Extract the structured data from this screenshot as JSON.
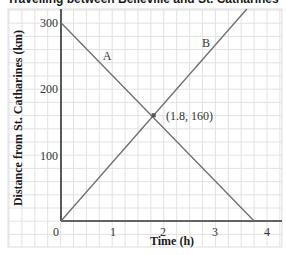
{
  "chart_data": {
    "type": "line",
    "title": "Travelling between Belleville and St. Catharines",
    "xlabel": "Time (h)",
    "ylabel": "Distance from St. Catharines (km)",
    "xlim": [
      0,
      4.2
    ],
    "ylim": [
      0,
      320
    ],
    "xticks": [
      0,
      1,
      2,
      3,
      4
    ],
    "yticks": [
      100,
      200,
      300
    ],
    "grid": true,
    "legend": "none",
    "series": [
      {
        "name": "A",
        "x": [
          0,
          1.8,
          3.75
        ],
        "values": [
          300,
          160,
          0
        ]
      },
      {
        "name": "B",
        "x": [
          0,
          1.8,
          3.6
        ],
        "values": [
          0,
          160,
          320
        ]
      }
    ],
    "annotations": [
      {
        "text": "(1.8, 160)",
        "x": 1.8,
        "y": 160,
        "marker": "square"
      },
      {
        "text": "A",
        "x": 0.85,
        "y": 250
      },
      {
        "text": "B",
        "x": 2.85,
        "y": 270
      }
    ],
    "colors": {
      "line": "#6e6e6e",
      "axis": "#333333",
      "grid": "#e2e2e2",
      "marker": "#555555"
    }
  },
  "labels": {
    "title": "Travelling between Belleville and St. Catharines",
    "xlabel": "Time (h)",
    "ylabel": "Distance from St. Catharines (km)",
    "origin": "0",
    "x1": "1",
    "x2": "2",
    "x3": "3",
    "x4": "4",
    "y100": "100",
    "y200": "200",
    "y300": "300",
    "lineA": "A",
    "lineB": "B",
    "intersection": "(1.8, 160)"
  }
}
